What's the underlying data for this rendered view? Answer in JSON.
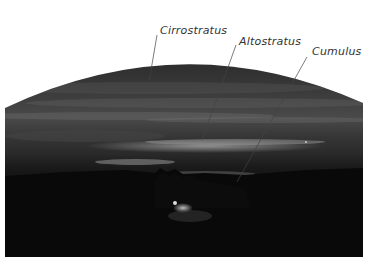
{
  "figure": {
    "labels": [
      {
        "text": "Cirrostratus",
        "x": 160,
        "y": 24
      },
      {
        "text": "Altostratus",
        "x": 239,
        "y": 35
      },
      {
        "text": "Cumulus",
        "x": 312,
        "y": 45
      }
    ],
    "colors": {
      "sky_top": "#2a2a2a",
      "sky_band": "#6a6a6a",
      "ground": "#070707",
      "label_text": "#333333",
      "leader_line": "#444444"
    }
  }
}
